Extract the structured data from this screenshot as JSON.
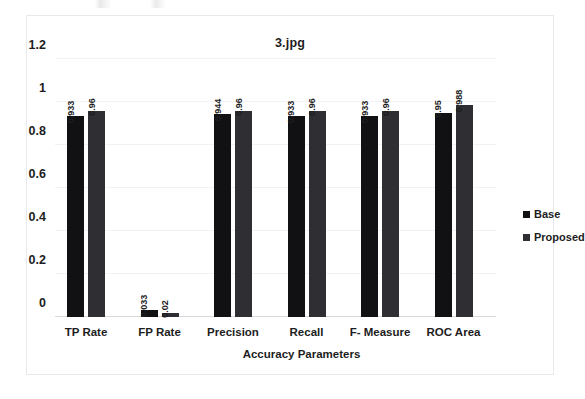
{
  "chart_data": {
    "type": "bar",
    "title": "3.jpg",
    "xlabel": "Accuracy Parameters",
    "ylabel": "",
    "ylim": [
      0,
      1.2
    ],
    "yticks": [
      "0",
      "0.2",
      "0.4",
      "0.6",
      "0.8",
      "1",
      "1.2"
    ],
    "ytick_values": [
      0,
      0.2,
      0.4,
      0.6,
      0.8,
      1,
      1.2
    ],
    "grid": true,
    "legend_position": "right",
    "categories": [
      "TP Rate",
      "FP Rate",
      "Precision",
      "Recall",
      "F- Measure",
      "ROC Area"
    ],
    "series": [
      {
        "name": "Base",
        "color": "#111114",
        "values": [
          0.933,
          0.033,
          0.944,
          0.933,
          0.933,
          0.95
        ],
        "labels": [
          "0.933",
          "0.033",
          "0.944",
          "0.933",
          "0.933",
          "0.95"
        ]
      },
      {
        "name": "Proposed",
        "color": "#2f2f33",
        "values": [
          0.96,
          0.02,
          0.96,
          0.96,
          0.96,
          0.988
        ],
        "labels": [
          "0.96",
          "0.02",
          "0.96",
          "0.96",
          "0.96",
          "0.988"
        ]
      }
    ]
  },
  "legend": {
    "items": [
      {
        "label": "Base",
        "color": "#111114"
      },
      {
        "label": "Proposed",
        "color": "#2f2f33"
      }
    ]
  }
}
